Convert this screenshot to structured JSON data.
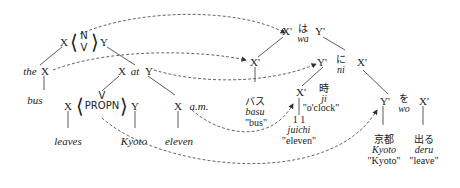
{
  "english_tree": {
    "root": {
      "left": "X",
      "right": "Y",
      "pos_top": "N",
      "pos_bottom": "V"
    },
    "subject": {
      "det": "the",
      "head": "X",
      "word": "bus"
    },
    "pp": {
      "left": "X",
      "prep": "at",
      "right": "Y"
    },
    "verb_phrase": {
      "left": "X",
      "pos": "PROPN",
      "pos_top": "V",
      "right": "Y",
      "verb_word": "leaves",
      "object_word": "Kyoto"
    },
    "time": {
      "head": "X",
      "suffix": "a.m.",
      "word": "eleven"
    }
  },
  "japanese_tree": {
    "top": {
      "left": "X'",
      "particle": "は",
      "particle_roman": "wa",
      "right": "Y'"
    },
    "subject": {
      "head": "X'",
      "word": "バス",
      "roman": "basu",
      "gloss": "\"bus\""
    },
    "ni_phrase": {
      "left": "Y'",
      "particle": "に",
      "particle_roman": "ni",
      "right": "X'"
    },
    "time": {
      "head": "X'",
      "number": "1 1",
      "roman": "juichi",
      "gloss": "\"eleven\"",
      "counter": "時",
      "counter_roman": "ji",
      "counter_gloss": "\"o'clock\""
    },
    "wo_phrase": {
      "left": "Y'",
      "particle": "を",
      "particle_roman": "wo",
      "right": "X'"
    },
    "object": {
      "word": "京都",
      "roman": "Kyoto",
      "gloss": "\"Kyoto\""
    },
    "verb": {
      "word": "出る",
      "roman": "deru",
      "gloss": "\"leave\""
    }
  },
  "colors": {
    "line": "#333333",
    "dashed": "#555555"
  }
}
